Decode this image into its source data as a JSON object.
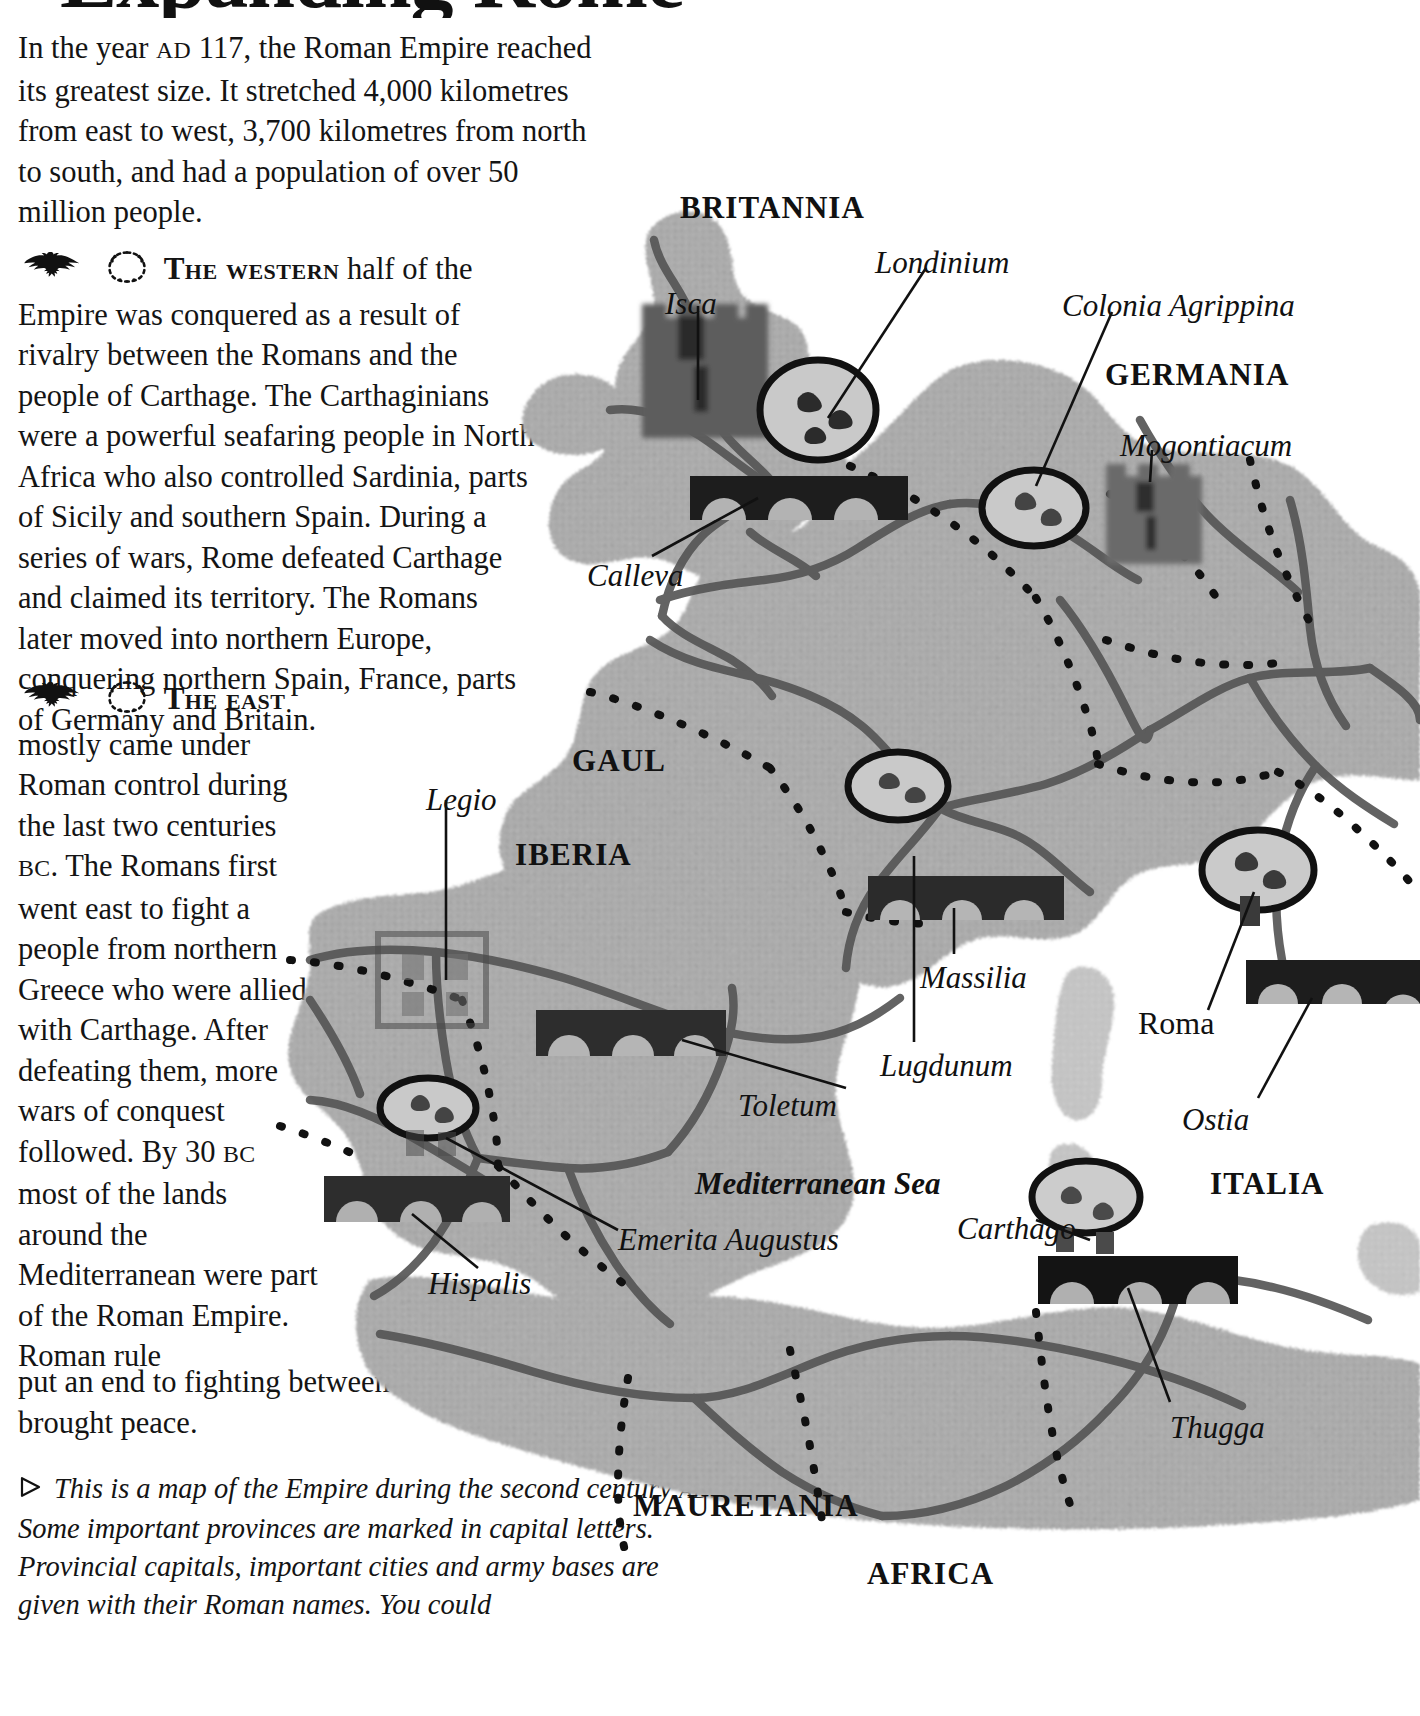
{
  "page": {
    "title": "Expanding Rome",
    "intro": "In the year AD 117, the Roman Empire reached its greatest size. It stretched 4,000 kilometres from east to west, 3,700 kilometres from north to south, and had a population of over 50 million people.",
    "intro_smallcaps": "AD"
  },
  "sections": [
    {
      "id": "western",
      "lead": "The western",
      "icon_eagle": "eagle-icon",
      "icon_wreath": "laurel-wreath-icon",
      "body": " half of the Empire was conquered as a result of rivalry between the Romans and the people of Carthage. The Carthaginians were a powerful seafaring people in North Africa who also controlled Sardinia, parts of Sicily and southern Spain. During a series of wars, Rome defeated Carthage and claimed its territory. The Romans later moved into northern Europe, conquering northern Spain, France, parts of Germany and Britain."
    },
    {
      "id": "east",
      "lead": "The east",
      "icon_eagle": "eagle-icon",
      "icon_wreath": "laurel-wreath-icon",
      "body_narrow": "mostly came under Roman control during the last two centuries BC. The Romans first went east to fight a people from northern Greece who were allied with Carthage. After defeating them, more wars of conquest followed. By 30 BC most of the lands around the Mediterranean were part of the Roman Empire. Roman rule",
      "body_tail": "put an end to fighting between rival states and brought peace."
    }
  ],
  "caption": {
    "marker": "triangle-bullet-icon",
    "text": "This is a map of the Empire during the second century AD. Some important provinces are marked in capital letters. Provincial capitals, important cities and army bases are given with their Roman names. You could"
  },
  "map": {
    "alt": "Relief map of the Roman Empire in the second century AD",
    "provinces": [
      {
        "name": "BRITANNIA",
        "x": 430,
        "y": 110
      },
      {
        "name": "GERMANIA",
        "x": 855,
        "y": 277
      },
      {
        "name": "GAUL",
        "x": 322,
        "y": 663
      },
      {
        "name": "IBERIA",
        "x": 265,
        "y": 757
      },
      {
        "name": "ITALIA",
        "x": 960,
        "y": 1086
      },
      {
        "name": "MAURETANIA",
        "x": 383,
        "y": 1408
      },
      {
        "name": "AFRICA",
        "x": 617,
        "y": 1476
      }
    ],
    "seas": [
      {
        "name": "Mediterranean Sea",
        "x": 445,
        "y": 1086
      }
    ],
    "cities": [
      {
        "name": "Isca",
        "x": 415,
        "y": 206
      },
      {
        "name": "Londinium",
        "x": 625,
        "y": 165
      },
      {
        "name": "Colonia Agrippina",
        "x": 812,
        "y": 208
      },
      {
        "name": "Mogontiacum",
        "x": 870,
        "y": 348
      },
      {
        "name": "Calleva",
        "x": 337,
        "y": 478
      },
      {
        "name": "Legio",
        "x": 176,
        "y": 702
      },
      {
        "name": "Toletum",
        "x": 488,
        "y": 1008
      },
      {
        "name": "Massilia",
        "x": 670,
        "y": 880
      },
      {
        "name": "Lugdunum",
        "x": 630,
        "y": 968
      },
      {
        "name": "Emerita Augustus",
        "x": 368,
        "y": 1142
      },
      {
        "name": "Hispalis",
        "x": 178,
        "y": 1186
      },
      {
        "name": "Roma",
        "x": 888,
        "y": 925
      },
      {
        "name": "Ostia",
        "x": 932,
        "y": 1022
      },
      {
        "name": "Carthago",
        "x": 707,
        "y": 1131
      },
      {
        "name": "Thugga",
        "x": 920,
        "y": 1330
      }
    ]
  },
  "colors": {
    "ink": "#141414",
    "land": "#a9a9a9",
    "land_light": "#bdbdbd",
    "road": "#4a4a4a",
    "border": "#111111",
    "monument": "#3d3d3d",
    "monument_dark": "#1a1a1a",
    "paper": "#ffffff"
  }
}
